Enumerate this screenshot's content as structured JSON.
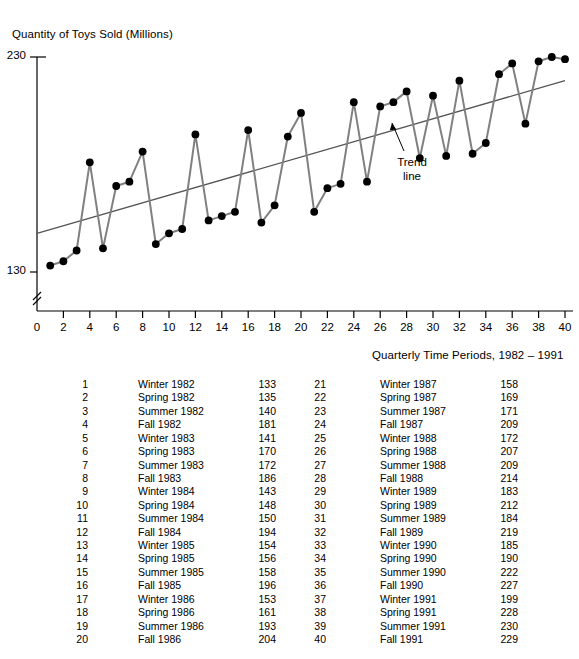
{
  "chart_data": {
    "type": "line",
    "title": "",
    "ylabel": "Quantity of Toys Sold (Millions)",
    "xlabel": "Quarterly Time  Periods, 1982 – 1991",
    "ylim": [
      130,
      230
    ],
    "xlim": [
      0,
      40
    ],
    "y_ticks": [
      130,
      230
    ],
    "y_axis_break": true,
    "x_ticks": [
      0,
      2,
      4,
      6,
      8,
      10,
      12,
      14,
      16,
      18,
      20,
      22,
      24,
      26,
      28,
      30,
      32,
      34,
      36,
      38,
      40
    ],
    "grid": false,
    "legend": false,
    "series_color": "#808080",
    "marker_color": "#000000",
    "trendline_color": "#555555",
    "annotations": [
      {
        "text": "Trend\nline",
        "line1": "Trend",
        "line2": "line",
        "target": "trend-line"
      }
    ],
    "x": [
      1,
      2,
      3,
      4,
      5,
      6,
      7,
      8,
      9,
      10,
      11,
      12,
      13,
      14,
      15,
      16,
      17,
      18,
      19,
      20,
      21,
      22,
      23,
      24,
      25,
      26,
      27,
      28,
      29,
      30,
      31,
      32,
      33,
      34,
      35,
      36,
      37,
      38,
      39,
      40
    ],
    "values": [
      133,
      135,
      140,
      181,
      141,
      170,
      172,
      186,
      143,
      148,
      150,
      194,
      154,
      156,
      158,
      196,
      153,
      161,
      193,
      204,
      158,
      169,
      171,
      209,
      172,
      207,
      209,
      214,
      183,
      212,
      184,
      219,
      185,
      190,
      222,
      227,
      199,
      228,
      230,
      229
    ],
    "trendline": {
      "x_start": 0,
      "y_start": 148,
      "x_end": 40,
      "y_end": 219
    }
  },
  "table": {
    "rows": [
      {
        "index": "1",
        "period": "Winter 1982",
        "value": "133"
      },
      {
        "index": "2",
        "period": "Spring 1982",
        "value": "135"
      },
      {
        "index": "3",
        "period": "Summer 1982",
        "value": "140"
      },
      {
        "index": "4",
        "period": "Fall 1982",
        "value": "181"
      },
      {
        "index": "5",
        "period": "Winter 1983",
        "value": "141"
      },
      {
        "index": "6",
        "period": "Spring 1983",
        "value": "170"
      },
      {
        "index": "7",
        "period": "Summer 1983",
        "value": "172"
      },
      {
        "index": "8",
        "period": "Fall 1983",
        "value": "186"
      },
      {
        "index": "9",
        "period": "Winter 1984",
        "value": "143"
      },
      {
        "index": "10",
        "period": "Spring 1984",
        "value": "148"
      },
      {
        "index": "11",
        "period": "Summer 1984",
        "value": "150"
      },
      {
        "index": "12",
        "period": "Fall 1984",
        "value": "194"
      },
      {
        "index": "13",
        "period": "Winter 1985",
        "value": "154"
      },
      {
        "index": "14",
        "period": "Spring 1985",
        "value": "156"
      },
      {
        "index": "15",
        "period": "Summer 1985",
        "value": "158"
      },
      {
        "index": "16",
        "period": "Fall 1985",
        "value": "196"
      },
      {
        "index": "17",
        "period": "Winter 1986",
        "value": "153"
      },
      {
        "index": "18",
        "period": "Spring 1986",
        "value": "161"
      },
      {
        "index": "19",
        "period": "Summer 1986",
        "value": "193"
      },
      {
        "index": "20",
        "period": "Fall 1986",
        "value": "204"
      },
      {
        "index": "21",
        "period": "Winter 1987",
        "value": "158"
      },
      {
        "index": "22",
        "period": "Spring 1987",
        "value": "169"
      },
      {
        "index": "23",
        "period": "Summer 1987",
        "value": "171"
      },
      {
        "index": "24",
        "period": "Fall 1987",
        "value": "209"
      },
      {
        "index": "25",
        "period": "Winter 1988",
        "value": "172"
      },
      {
        "index": "26",
        "period": "Spring 1988",
        "value": "207"
      },
      {
        "index": "27",
        "period": "Summer 1988",
        "value": "209"
      },
      {
        "index": "28",
        "period": "Fall 1988",
        "value": "214"
      },
      {
        "index": "29",
        "period": "Winter 1989",
        "value": "183"
      },
      {
        "index": "30",
        "period": "Spring 1989",
        "value": "212"
      },
      {
        "index": "31",
        "period": "Summer 1989",
        "value": "184"
      },
      {
        "index": "32",
        "period": "Fall 1989",
        "value": "219"
      },
      {
        "index": "33",
        "period": "Winter 1990",
        "value": "185"
      },
      {
        "index": "34",
        "period": "Spring 1990",
        "value": "190"
      },
      {
        "index": "35",
        "period": "Summer 1990",
        "value": "222"
      },
      {
        "index": "36",
        "period": "Fall 1990",
        "value": "227"
      },
      {
        "index": "37",
        "period": "Winter 1991",
        "value": "199"
      },
      {
        "index": "38",
        "period": "Spring 1991",
        "value": "228"
      },
      {
        "index": "39",
        "period": "Summer 1991",
        "value": "230"
      },
      {
        "index": "40",
        "period": "Fall 1991",
        "value": "229"
      }
    ]
  }
}
